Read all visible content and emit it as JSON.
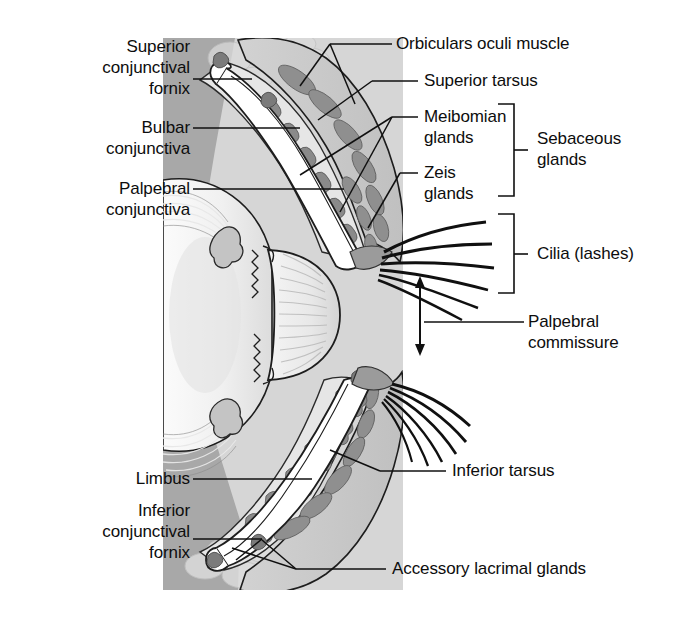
{
  "figure": {
    "type": "anatomical-diagram",
    "panel": {
      "x": 163,
      "y": 38,
      "width": 240,
      "height": 552,
      "colors": {
        "background": "#ffffff",
        "tissue_light": "#e2e2e2",
        "tissue_mid": "#c8c8c8",
        "tissue_dark": "#a0a0a0",
        "gland": "#8d8d8d",
        "outline": "#1a1a1a",
        "sclera": "#f2f2f2"
      }
    }
  },
  "labels": {
    "left": [
      {
        "id": "superior-conjunctival-fornix",
        "text": "Superior\nconjunctival\nfornix",
        "x": 40,
        "y": 36,
        "w": 150,
        "lead_from": [
          192,
          79
        ],
        "lead_to": [
          252,
          79
        ]
      },
      {
        "id": "bulbar-conjunctiva",
        "text": "Bulbar\nconjunctiva",
        "x": 40,
        "y": 117,
        "w": 150,
        "lead_from": [
          192,
          128
        ],
        "lead_to": [
          296,
          128
        ]
      },
      {
        "id": "palpebral-conjunctiva",
        "text": "Palpebral\nconjunctiva",
        "x": 40,
        "y": 178,
        "w": 150,
        "lead_from": [
          192,
          189
        ],
        "lead_to": [
          338,
          189
        ]
      },
      {
        "id": "limbus",
        "text": "Limbus",
        "x": 78,
        "y": 468,
        "w": 112,
        "lead_from": [
          192,
          479
        ],
        "lead_to": [
          307,
          479
        ]
      },
      {
        "id": "inferior-conjunctival-fornix",
        "text": "Inferior\nconjunctival\nfornix",
        "x": 40,
        "y": 500,
        "w": 150,
        "lead_from": [
          192,
          539
        ],
        "lead_to": [
          268,
          539
        ]
      }
    ],
    "right": [
      {
        "id": "orbicularis-oculi-muscle",
        "text": "Orbiculars oculi muscle",
        "x": 396,
        "y": 33,
        "lead_from": [
          392,
          44
        ],
        "lead_to": [
          310,
          83
        ]
      },
      {
        "id": "superior-tarsus",
        "text": "Superior tarsus",
        "x": 424,
        "y": 70,
        "lead_from": [
          420,
          81
        ],
        "lead_to": [
          345,
          108
        ]
      },
      {
        "id": "meibomian-glands",
        "text": "Meibomian\nglands",
        "x": 424,
        "y": 106,
        "lead_from": [
          420,
          117
        ],
        "lead_to": [
          321,
          155
        ]
      },
      {
        "id": "zeis-glands",
        "text": "Zeis\nglands",
        "x": 424,
        "y": 162,
        "lead_from": [
          420,
          173
        ],
        "lead_to": [
          372,
          219
        ]
      },
      {
        "id": "sebaceous-glands",
        "text": "Sebaceous\nglands",
        "x": 537,
        "y": 128,
        "bracket": {
          "x": 514,
          "y_top": 104,
          "y_bottom": 196,
          "tick_y": 150
        }
      },
      {
        "id": "cilia-lashes",
        "text": "Cilia (lashes)",
        "x": 537,
        "y": 243,
        "bracket": {
          "x": 514,
          "y_top": 214,
          "y_bottom": 293,
          "tick_y": 254
        }
      },
      {
        "id": "palpebral-commissure",
        "text": "Palpebral\ncommissure",
        "x": 528,
        "y": 311,
        "lead_from": [
          524,
          322
        ],
        "lead_to": [
          420,
          322
        ]
      },
      {
        "id": "inferior-tarsus",
        "text": "Inferior tarsus",
        "x": 452,
        "y": 460,
        "lead_from": [
          448,
          471
        ],
        "lead_to": [
          372,
          471
        ]
      },
      {
        "id": "accessory-lacrimal-glands",
        "text": "Accessory lacrimal glands",
        "x": 392,
        "y": 558,
        "lead_from": [
          388,
          569
        ],
        "lead_to": [
          290,
          569
        ]
      }
    ]
  },
  "commissure_arrow": {
    "x": 420,
    "y_top": 278,
    "y_bottom": 352,
    "double_headed": true
  }
}
